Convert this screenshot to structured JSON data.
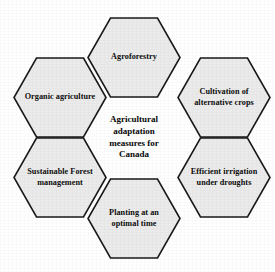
{
  "diagram": {
    "type": "hexagon-cluster",
    "center": {
      "label": "Agricultural adaptation measures for Canada",
      "lines": [
        "Agricultural",
        "adaptation",
        "measures for",
        "Canada"
      ]
    },
    "colors": {
      "hex_fill": "#ebebeb",
      "hex_stroke": "#1a1a1a",
      "text": "#0d0d0d",
      "background": "#ffffff"
    },
    "nodes": [
      {
        "id": "agroforestry",
        "position": "top",
        "label": "Agroforestry"
      },
      {
        "id": "cultivation-alt-crops",
        "position": "upper-right",
        "label": "Cultivation of alternative crops"
      },
      {
        "id": "efficient-irrigation",
        "position": "lower-right",
        "label": "Efficient irrigation under droughts"
      },
      {
        "id": "planting-optimal-time",
        "position": "bottom",
        "label": "Planting at an optimal time"
      },
      {
        "id": "sustainable-forest-mgmt",
        "position": "lower-left",
        "label": "Sustainable Forest management"
      },
      {
        "id": "organic-agriculture",
        "position": "upper-left",
        "label": "Organic agriculture"
      }
    ]
  }
}
